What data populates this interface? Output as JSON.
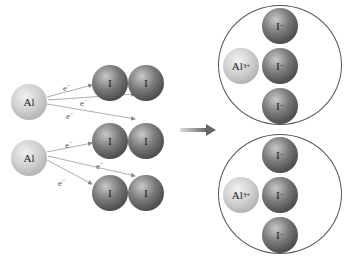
{
  "reactants": {
    "aluminum_atoms": [
      {
        "label": "Al"
      },
      {
        "label": "Al"
      }
    ],
    "iodine_molecules": [
      {
        "atoms": [
          {
            "label": "I"
          },
          {
            "label": "I"
          }
        ]
      },
      {
        "atoms": [
          {
            "label": "I"
          },
          {
            "label": "I"
          }
        ]
      },
      {
        "atoms": [
          {
            "label": "I"
          },
          {
            "label": "I"
          }
        ]
      }
    ],
    "electron_label": "e",
    "electron_charge": "−"
  },
  "reaction_arrow": "right-arrow",
  "products": [
    {
      "cation": {
        "label": "Al",
        "charge": "3+"
      },
      "anions": [
        {
          "label": "I",
          "charge": "−"
        },
        {
          "label": "I",
          "charge": "−"
        },
        {
          "label": "I",
          "charge": "−"
        }
      ]
    },
    {
      "cation": {
        "label": "Al",
        "charge": "3+"
      },
      "anions": [
        {
          "label": "I",
          "charge": "−"
        },
        {
          "label": "I",
          "charge": "−"
        },
        {
          "label": "I",
          "charge": "−"
        }
      ]
    }
  ],
  "colors": {
    "aluminum": "#c8c8c8",
    "iodine": "#5a5a5a",
    "arrow": "#777777",
    "ring": "#555555"
  }
}
